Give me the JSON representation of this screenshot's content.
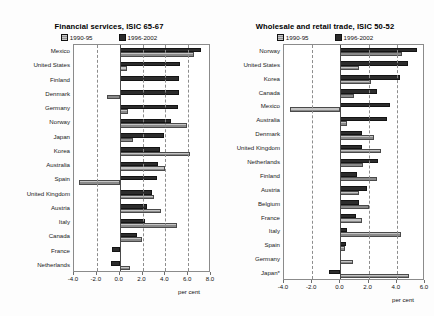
{
  "legend": {
    "series_a": "1990-95",
    "series_b": "1996-2002"
  },
  "axis_unit": "per cent",
  "chart_data": [
    {
      "type": "bar",
      "orientation": "horizontal",
      "title": "Financial services, ISIC 65-67",
      "xlabel": "per cent",
      "ylabel": "",
      "xlim": [
        -4.0,
        8.0
      ],
      "xticks": [
        "-4.0",
        "-2.0",
        "0.0",
        "2.0",
        "4.0",
        "6.0",
        "8.0"
      ],
      "grid": "vertical-dashed",
      "legend_position": "top-center",
      "categories": [
        "Mexico",
        "United States",
        "Finland",
        "Denmark",
        "Germany",
        "Norway",
        "Japan",
        "Korea",
        "Australia",
        "Spain",
        "United Kingdom",
        "Austria",
        "Italy",
        "Canada",
        "France",
        "Netherlands"
      ],
      "series": [
        {
          "name": "1990-95",
          "values": [
            6.5,
            0.6,
            0.0,
            -1.1,
            0.7,
            5.9,
            1.2,
            6.2,
            4.0,
            -3.6,
            3.0,
            3.6,
            5.0,
            2.0,
            0.0,
            0.9
          ]
        },
        {
          "name": "1996-2002",
          "values": [
            7.1,
            5.3,
            5.2,
            5.2,
            5.1,
            4.5,
            3.9,
            3.5,
            3.4,
            3.3,
            2.8,
            2.4,
            2.2,
            1.5,
            -0.7,
            -0.8
          ]
        }
      ]
    },
    {
      "type": "bar",
      "orientation": "horizontal",
      "title": "Wholesale and retail trade, ISIC 50-52",
      "xlabel": "per cent",
      "ylabel": "",
      "xlim": [
        -4.0,
        6.0
      ],
      "xticks": [
        "-4.0",
        "-2.0",
        "0.0",
        "2.0",
        "4.0",
        "6.0"
      ],
      "grid": "vertical-dashed",
      "legend_position": "top-center",
      "categories": [
        "Norway",
        "United States",
        "Korea",
        "Canada",
        "Mexico",
        "Australia",
        "Denmark",
        "United Kingdom",
        "Netherlands",
        "Finland",
        "Austria",
        "Belgium",
        "France",
        "Italy",
        "Spain",
        "Germany",
        "Japan*"
      ],
      "series": [
        {
          "name": "1990-95",
          "values": [
            4.4,
            1.3,
            2.2,
            1.0,
            -3.6,
            0.5,
            2.4,
            2.9,
            1.6,
            2.6,
            1.3,
            2.0,
            1.5,
            4.3,
            0.3,
            0.9,
            4.9
          ]
        },
        {
          "name": "1996-2002",
          "values": [
            5.4,
            4.8,
            4.2,
            2.6,
            3.5,
            3.3,
            1.5,
            1.5,
            2.7,
            1.2,
            1.9,
            1.3,
            1.1,
            0.5,
            0.4,
            0.0,
            -0.8
          ]
        }
      ]
    }
  ]
}
